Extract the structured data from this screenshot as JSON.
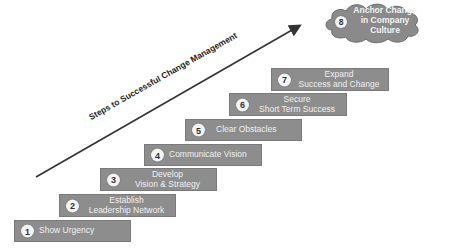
{
  "diagram": {
    "arrow_label": "Steps to Successful Change Management",
    "colors": {
      "step_fill": "#8d8d8d",
      "step_text": "#f0f0f0",
      "badge_fill": "#f4f4f4",
      "arrow": "#333333",
      "cloud_fill": "#8a8a8a"
    },
    "steps": [
      {
        "number": "1",
        "line1": "Show Urgency",
        "line2": ""
      },
      {
        "number": "2",
        "line1": "Establish",
        "line2": "Leadership Network"
      },
      {
        "number": "3",
        "line1": "Develop",
        "line2": "Vision & Strategy"
      },
      {
        "number": "4",
        "line1": "Communicate Vision",
        "line2": ""
      },
      {
        "number": "5",
        "line1": "Clear Obstacles",
        "line2": ""
      },
      {
        "number": "6",
        "line1": "Secure",
        "line2": "Short Term Success"
      },
      {
        "number": "7",
        "line1": "Expand",
        "line2": "Success and Change"
      }
    ],
    "final_step": {
      "number": "8",
      "line1": "Anchor Change",
      "line2": "in Company",
      "line3": "Culture"
    }
  }
}
